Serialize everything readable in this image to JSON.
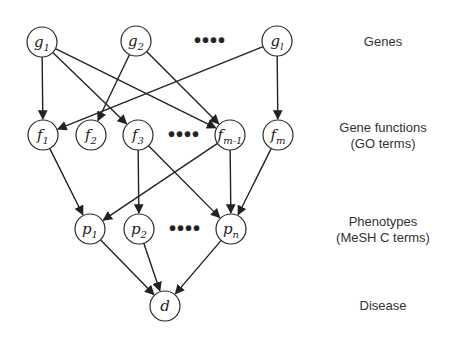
{
  "diagram": {
    "layers": [
      {
        "id": "genes",
        "label_line1": "Genes",
        "label_line2": ""
      },
      {
        "id": "functions",
        "label_line1": "Gene functions",
        "label_line2": "(GO terms)"
      },
      {
        "id": "phenotypes",
        "label_line1": "Phenotypes",
        "label_line2": "(MeSH C terms)"
      },
      {
        "id": "disease",
        "label_line1": "Disease",
        "label_line2": ""
      }
    ],
    "nodes": [
      {
        "id": "g1",
        "base": "g",
        "sub": "1",
        "x": 42,
        "y": 42
      },
      {
        "id": "g2",
        "base": "g",
        "sub": "2",
        "x": 136,
        "y": 41
      },
      {
        "id": "gl",
        "base": "g",
        "sub": "l",
        "x": 277,
        "y": 41
      },
      {
        "id": "f1",
        "base": "f",
        "sub": "1",
        "x": 43,
        "y": 135
      },
      {
        "id": "f2",
        "base": "f",
        "sub": "2",
        "x": 91,
        "y": 135
      },
      {
        "id": "f3",
        "base": "f",
        "sub": "3",
        "x": 138,
        "y": 135
      },
      {
        "id": "fm-1",
        "base": "f",
        "sub": "m-1",
        "x": 230,
        "y": 135
      },
      {
        "id": "fm",
        "base": "f",
        "sub": "m",
        "x": 278,
        "y": 135
      },
      {
        "id": "p1",
        "base": "p",
        "sub": "1",
        "x": 90,
        "y": 229
      },
      {
        "id": "p2",
        "base": "p",
        "sub": "2",
        "x": 139,
        "y": 229
      },
      {
        "id": "pn",
        "base": "p",
        "sub": "n",
        "x": 231,
        "y": 229
      },
      {
        "id": "d",
        "base": "d",
        "sub": "",
        "x": 165,
        "y": 306
      }
    ],
    "edges": [
      [
        "g1",
        "f1"
      ],
      [
        "g1",
        "f3"
      ],
      [
        "g1",
        "fm-1"
      ],
      [
        "g2",
        "f2"
      ],
      [
        "g2",
        "fm-1"
      ],
      [
        "gl",
        "f1"
      ],
      [
        "gl",
        "fm"
      ],
      [
        "f1",
        "p1"
      ],
      [
        "f3",
        "p2"
      ],
      [
        "f3",
        "pn"
      ],
      [
        "fm-1",
        "p1"
      ],
      [
        "fm-1",
        "pn"
      ],
      [
        "fm",
        "pn"
      ],
      [
        "p1",
        "d"
      ],
      [
        "p2",
        "d"
      ],
      [
        "pn",
        "d"
      ]
    ],
    "ellipses": [
      {
        "text": "••••",
        "x": 210,
        "y": 47
      },
      {
        "text": "••••",
        "x": 184,
        "y": 141
      },
      {
        "text": "••••",
        "x": 185,
        "y": 235
      }
    ],
    "node_radius": 15,
    "stroke_color": "#222222",
    "background_color": "#ffffff"
  }
}
